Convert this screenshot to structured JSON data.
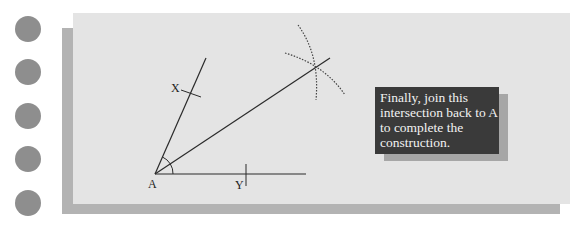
{
  "figure": {
    "points": {
      "A": {
        "label": "A"
      },
      "X": {
        "label": "X"
      },
      "Y": {
        "label": "Y"
      }
    },
    "note": {
      "lines": [
        "Finally, join this",
        "intersection back to A",
        "to complete the",
        "construction."
      ]
    }
  },
  "colors": {
    "dot": "#8e8e8e",
    "card": "#e4e4e4",
    "card_shadow": "#b3b3b3",
    "note_bg": "#3a3a3a",
    "note_text": "#f2f2f2",
    "line": "#222222"
  },
  "side_dots": {
    "count": 5
  }
}
